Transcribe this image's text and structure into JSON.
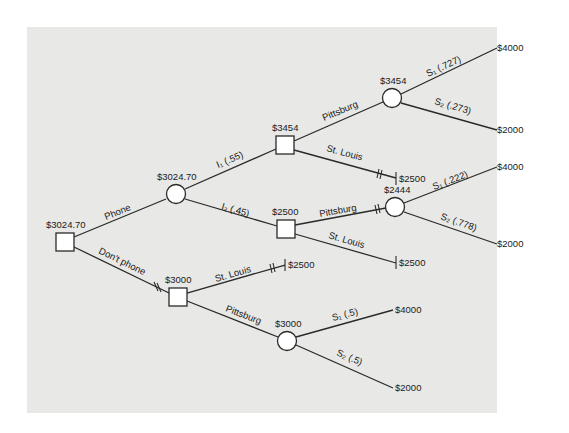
{
  "diagram": {
    "type": "decision-tree",
    "background": "#e8e8e6",
    "line_color": "#2a2a2a",
    "node_fill": "#ffffff",
    "root": {
      "kind": "decision",
      "value": "$3024.70"
    },
    "branches": {
      "phone": {
        "label": "Phone"
      },
      "dont_phone": {
        "label": "Don't phone"
      }
    },
    "phone_chance": {
      "kind": "chance",
      "value": "$3024.70"
    },
    "i1": {
      "label": "I₁ (.55)",
      "value": "$3454"
    },
    "i2": {
      "label": "I₂ (.45)",
      "value": "$2500"
    },
    "i1_pittsburg": {
      "label": "Pittsburg",
      "value": "$3454"
    },
    "i1_stlouis": {
      "label": "St. Louis",
      "payoff": "$2500"
    },
    "i1_s1": {
      "label": "S₁ (.727)",
      "payoff": "$4000"
    },
    "i1_s2": {
      "label": "S₂ (.273)",
      "payoff": "$2000"
    },
    "i2_pittsburg": {
      "label": "Pittsburg",
      "value": "$2444"
    },
    "i2_stlouis": {
      "label": "St. Louis",
      "payoff": "$2500"
    },
    "i2_s1": {
      "label": "S₁ (.222)",
      "payoff": "$4000"
    },
    "i2_s2": {
      "label": "S₂ (.778)",
      "payoff": "$2000"
    },
    "dp": {
      "kind": "decision",
      "value": "$3000"
    },
    "dp_stlouis": {
      "label": "St. Louis",
      "payoff": "$2500"
    },
    "dp_pittsburg": {
      "label": "Pittsburg",
      "value": "$3000"
    },
    "dp_s1": {
      "label": "S₁ (.5)",
      "payoff": "$4000"
    },
    "dp_s2": {
      "label": "S₂ (.5)",
      "payoff": "$2000"
    }
  }
}
